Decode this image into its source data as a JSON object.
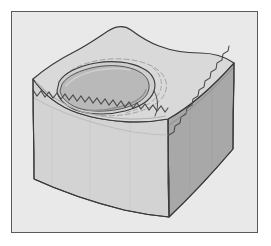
{
  "figure": {
    "title": "Block diagram of a rectangular earth block with an oval surface depression",
    "frame": {
      "border_color": "#5a5a5a",
      "background_color": "#e9e9e9",
      "x": 11,
      "y": 11,
      "width": 247,
      "height": 222
    },
    "colors": {
      "page_background": "#ffffff",
      "top_face": "#d9d9d9",
      "front_face": "#d3d3d3",
      "right_face": "#a8a8a8",
      "depression_rim": "#cfcfcf",
      "depression_interior": "#b9b9b9",
      "outline": "#3a3a3a",
      "ghost_contour": "#9a9a9a"
    },
    "elements": [
      {
        "name": "top-face",
        "label": "Top surface of block",
        "description": "Irregular quadrilateral upper surface, light gray, with undulating edges"
      },
      {
        "name": "front-face",
        "label": "Front-left vertical face",
        "description": "Light gray vertical side with a horizontal sawtooth stratigraphic band"
      },
      {
        "name": "right-face",
        "label": "Right vertical face",
        "description": "Darker shaded vertical side with a diagonal sawtooth stratigraphic band"
      },
      {
        "name": "depression",
        "label": "Oval depression",
        "description": "Shallow oval basin set into the top face, slightly darker interior with a shaded rim"
      },
      {
        "name": "ghost-contour",
        "label": "Faint outer contour of depression",
        "description": "Light dashed-looking contour line tracing an earlier or wider rim around the depression"
      },
      {
        "name": "sawtooth-front",
        "label": "Front sawtooth layer line",
        "description": "Zigzag line marking a subsurface stratigraphic contact on the front face"
      },
      {
        "name": "sawtooth-right",
        "label": "Right sawtooth layer line",
        "description": "Zigzag line marking the same stratigraphic contact on the right face"
      }
    ]
  }
}
